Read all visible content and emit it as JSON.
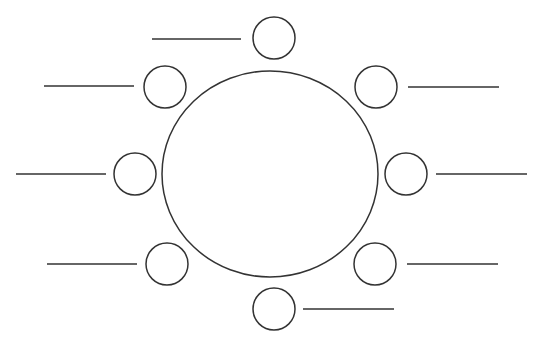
{
  "diagram": {
    "type": "cluster-diagram",
    "stroke_color": "#333333",
    "background": "#ffffff",
    "center_circle": {
      "cx": 270,
      "cy": 174,
      "rx": 108,
      "ry": 103
    },
    "nodes": [
      {
        "id": "top",
        "cx": 274,
        "cy": 38,
        "r": 21,
        "label": "",
        "line": {
          "x1": 152,
          "y1": 39,
          "x2": 241,
          "y2": 39
        }
      },
      {
        "id": "top-right",
        "cx": 376,
        "cy": 87,
        "r": 21,
        "label": "",
        "line": {
          "x1": 408,
          "y1": 87,
          "x2": 499,
          "y2": 87
        }
      },
      {
        "id": "right",
        "cx": 406,
        "cy": 174,
        "r": 21,
        "label": "",
        "line": {
          "x1": 436,
          "y1": 174,
          "x2": 527,
          "y2": 174
        }
      },
      {
        "id": "bottom-right",
        "cx": 375,
        "cy": 264,
        "r": 21,
        "label": "",
        "line": {
          "x1": 407,
          "y1": 264,
          "x2": 498,
          "y2": 264
        }
      },
      {
        "id": "bottom",
        "cx": 274,
        "cy": 309,
        "r": 21,
        "label": "",
        "line": {
          "x1": 303,
          "y1": 309,
          "x2": 394,
          "y2": 309
        }
      },
      {
        "id": "bottom-left",
        "cx": 167,
        "cy": 264,
        "r": 21,
        "label": "",
        "line": {
          "x1": 47,
          "y1": 264,
          "x2": 137,
          "y2": 264
        }
      },
      {
        "id": "left",
        "cx": 135,
        "cy": 174,
        "r": 21,
        "label": "",
        "line": {
          "x1": 16,
          "y1": 174,
          "x2": 106,
          "y2": 174
        }
      },
      {
        "id": "top-left",
        "cx": 165,
        "cy": 87,
        "r": 21,
        "label": "",
        "line": {
          "x1": 44,
          "y1": 86,
          "x2": 134,
          "y2": 86
        }
      }
    ]
  }
}
